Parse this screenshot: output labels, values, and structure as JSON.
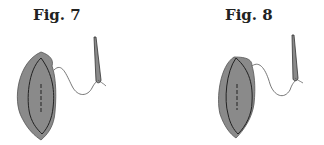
{
  "figures": [
    {
      "label": "Fig. 7",
      "fill": "#8a8a8a",
      "outline": "#333333"
    },
    {
      "label": "Fig. 8",
      "fill": "#8a8a8a",
      "outline": "#333333"
    }
  ]
}
